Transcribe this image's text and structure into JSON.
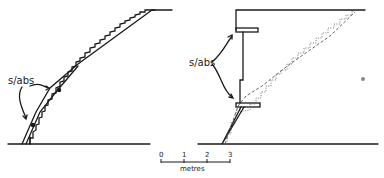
{
  "diagram": {
    "type": "section drawings",
    "left_panel": {
      "label": "s/abs",
      "description": "inclined slabs following stepped stair profile"
    },
    "right_panel": {
      "label": "s/abs",
      "description": "vertical wall with two cantilevered slabs; dashed and dotted stair outlines"
    },
    "scale_bar": {
      "ticks": [
        "0",
        "1",
        "2",
        "3"
      ],
      "unit": "metres"
    },
    "colors": {
      "ink": "#1a1a1a",
      "faint": "#777777",
      "background": "#ffffff"
    }
  }
}
